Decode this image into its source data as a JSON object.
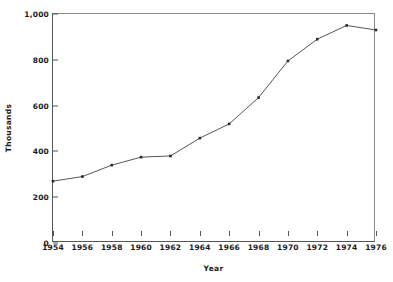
{
  "chart_data": {
    "type": "line",
    "title": "",
    "subtitle": "",
    "xlabel": "Year",
    "ylabel": "Thousands",
    "x": [
      1954,
      1956,
      1958,
      1960,
      1962,
      1964,
      1966,
      1968,
      1970,
      1972,
      1974,
      1976
    ],
    "values": [
      270,
      290,
      340,
      375,
      380,
      458,
      520,
      635,
      795,
      890,
      950,
      930
    ],
    "series": [
      {
        "name": "",
        "values": [
          270,
          290,
          340,
          375,
          380,
          458,
          520,
          635,
          795,
          890,
          950,
          930
        ]
      }
    ],
    "x_tick_labels": [
      "1954",
      "1956",
      "1958",
      "1960",
      "1962",
      "1964",
      "1966",
      "1968",
      "1970",
      "1972",
      "1974",
      "1976"
    ],
    "y_tick_labels": [
      "0",
      "200",
      "400",
      "600",
      "800",
      "1,000"
    ],
    "y_tick_values": [
      0,
      200,
      400,
      600,
      800,
      1000
    ],
    "xlim": [
      1954,
      1976
    ],
    "ylim": [
      0,
      1000
    ],
    "grid": false,
    "legend": "none",
    "marker": "square",
    "line_color": "#555555",
    "marker_color": "#2b2b2b"
  }
}
